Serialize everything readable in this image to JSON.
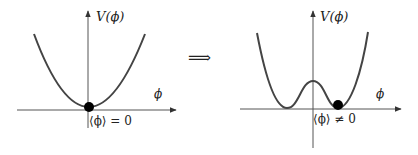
{
  "left_panel": {
    "y_label": "V(ϕ)",
    "x_label": "ϕ",
    "vev_label": "⟨ϕ⟩ = 0"
  },
  "implies": "⟹",
  "right_panel": {
    "y_label": "V(ϕ)",
    "x_label": "ϕ",
    "vev_label": "⟨ϕ⟩ ≠ 0"
  },
  "colors": {
    "curve": "#444444",
    "axis": "#555555",
    "dot": "#000000"
  }
}
